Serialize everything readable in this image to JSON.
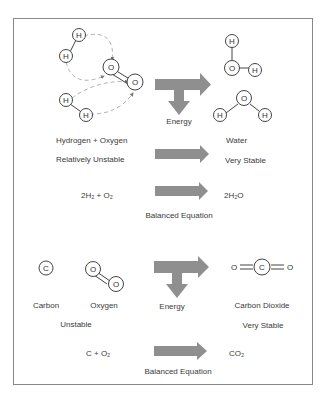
{
  "diagram": {
    "title": "",
    "section_water": {
      "reactant_label": "Hydrogen + Oxygen",
      "reactant_stability": "Relatively Unstable",
      "product_label": "Water",
      "product_stability": "Very Stable",
      "energy_label": "Energy",
      "equation_left": "2H₂ + O₂",
      "equation_right": "2H₂O",
      "equation_caption": "Balanced Equation",
      "atoms": {
        "hydrogen": "H",
        "oxygen": "O"
      }
    },
    "section_carbon": {
      "carbon_label": "Carbon",
      "oxygen_label": "Oxygen",
      "reactant_stability": "Unstable",
      "energy_label": "Energy",
      "product_label": "Carbon Dioxide",
      "product_stability": "Very Stable",
      "equation_left": "C + O₂",
      "equation_right": "CO₂",
      "equation_caption": "Balanced Equation",
      "atoms": {
        "carbon": "C",
        "oxygen": "O"
      }
    },
    "colors": {
      "arrow": "#8f8f8f",
      "frame": "#888888",
      "dashed": "#9a9a9a",
      "text": "#3a3a3a"
    }
  }
}
